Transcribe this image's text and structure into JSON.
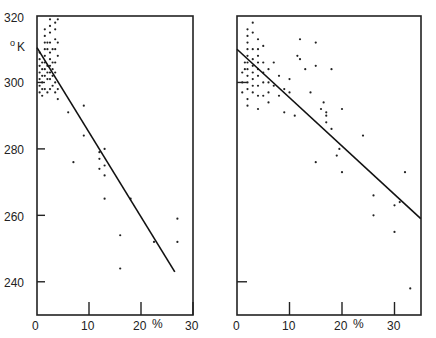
{
  "chart_data": [
    {
      "type": "scatter",
      "title": "",
      "xlabel": "%",
      "ylabel": "°K",
      "xlim": [
        0,
        30
      ],
      "ylim": [
        230,
        320
      ],
      "x_ticks": [
        0,
        10,
        20,
        30
      ],
      "x_tick_labels": [
        "0",
        "10",
        "20 %",
        "30"
      ],
      "y_ticks": [
        240,
        260,
        280,
        300,
        320
      ],
      "y_tick_labels": [
        "240",
        "260",
        "280",
        "300",
        "320"
      ],
      "grid": false,
      "legend": null,
      "fit_line": {
        "x": [
          0,
          26.5
        ],
        "y": [
          310.5,
          243
        ]
      },
      "points": [
        [
          0.5,
          309
        ],
        [
          0.5,
          307
        ],
        [
          0.5,
          305
        ],
        [
          0.5,
          303
        ],
        [
          0.5,
          301
        ],
        [
          0.5,
          299
        ],
        [
          0.5,
          297
        ],
        [
          1.0,
          306
        ],
        [
          1.0,
          304
        ],
        [
          1.0,
          302
        ],
        [
          1.0,
          300
        ],
        [
          1.0,
          298
        ],
        [
          1.0,
          296
        ],
        [
          1.5,
          316
        ],
        [
          1.5,
          314
        ],
        [
          1.5,
          312
        ],
        [
          1.5,
          310
        ],
        [
          1.5,
          308
        ],
        [
          1.5,
          306
        ],
        [
          1.5,
          304
        ],
        [
          1.5,
          302
        ],
        [
          1.5,
          298
        ],
        [
          2.0,
          312
        ],
        [
          2.0,
          310
        ],
        [
          2.0,
          305
        ],
        [
          2.0,
          303
        ],
        [
          2.0,
          301
        ],
        [
          2.0,
          297
        ],
        [
          2.5,
          319
        ],
        [
          2.5,
          317
        ],
        [
          2.5,
          315
        ],
        [
          2.5,
          312
        ],
        [
          2.5,
          309
        ],
        [
          2.5,
          307
        ],
        [
          2.5,
          305
        ],
        [
          2.5,
          303
        ],
        [
          2.5,
          301
        ],
        [
          2.5,
          298
        ],
        [
          3.0,
          310
        ],
        [
          3.0,
          306
        ],
        [
          3.0,
          304
        ],
        [
          3.0,
          302
        ],
        [
          3.0,
          299
        ],
        [
          3.5,
          318
        ],
        [
          3.5,
          316
        ],
        [
          3.5,
          313
        ],
        [
          3.5,
          310
        ],
        [
          3.5,
          306
        ],
        [
          3.5,
          303
        ],
        [
          3.5,
          300
        ],
        [
          3.5,
          297
        ],
        [
          4.0,
          319
        ],
        [
          4.0,
          312
        ],
        [
          4.0,
          308
        ],
        [
          4.0,
          298
        ],
        [
          4.0,
          295
        ],
        [
          6.0,
          291
        ],
        [
          7.0,
          276
        ],
        [
          9.0,
          293
        ],
        [
          9.0,
          284
        ],
        [
          12.0,
          279
        ],
        [
          12.0,
          277
        ],
        [
          12.0,
          274
        ],
        [
          13.0,
          280
        ],
        [
          13.0,
          275
        ],
        [
          13.0,
          272
        ],
        [
          13.0,
          265
        ],
        [
          16.0,
          254
        ],
        [
          16.0,
          244
        ],
        [
          18.0,
          265
        ],
        [
          22.5,
          252
        ],
        [
          27.0,
          259
        ],
        [
          27.0,
          252
        ]
      ]
    },
    {
      "type": "scatter",
      "title": "",
      "xlabel": "%",
      "ylabel": "",
      "xlim": [
        0,
        35
      ],
      "ylim": [
        230,
        320
      ],
      "x_ticks": [
        0,
        10,
        20,
        30
      ],
      "x_tick_labels": [
        "0",
        "10",
        "20 %",
        "30"
      ],
      "y_ticks": [
        240,
        300
      ],
      "y_tick_labels": [],
      "grid": false,
      "legend": null,
      "fit_line": {
        "x": [
          0,
          35
        ],
        "y": [
          310,
          259
        ]
      },
      "points": [
        [
          2.0,
          316
        ],
        [
          2.0,
          314
        ],
        [
          2.0,
          312
        ],
        [
          2.0,
          310
        ],
        [
          2.0,
          308
        ],
        [
          2.0,
          306
        ],
        [
          2.0,
          304
        ],
        [
          2.0,
          302
        ],
        [
          2.0,
          300
        ],
        [
          2.0,
          298
        ],
        [
          2.0,
          295
        ],
        [
          2.0,
          293
        ],
        [
          1.0,
          303
        ],
        [
          1.0,
          300
        ],
        [
          1.0,
          297
        ],
        [
          1.5,
          306
        ],
        [
          1.5,
          304
        ],
        [
          3.0,
          318
        ],
        [
          3.0,
          315
        ],
        [
          3.0,
          310
        ],
        [
          3.0,
          307
        ],
        [
          3.0,
          305
        ],
        [
          3.0,
          303
        ],
        [
          3.0,
          301
        ],
        [
          3.0,
          299
        ],
        [
          3.0,
          297
        ],
        [
          4.0,
          313
        ],
        [
          4.0,
          310
        ],
        [
          4.0,
          308
        ],
        [
          4.0,
          306
        ],
        [
          4.0,
          304
        ],
        [
          4.0,
          302
        ],
        [
          4.0,
          299
        ],
        [
          4.0,
          296
        ],
        [
          4.0,
          292
        ],
        [
          5.0,
          311
        ],
        [
          5.0,
          306
        ],
        [
          5.0,
          303
        ],
        [
          5.0,
          300
        ],
        [
          5.0,
          296
        ],
        [
          6.0,
          304
        ],
        [
          6.0,
          300
        ],
        [
          6.0,
          297
        ],
        [
          6.0,
          294
        ],
        [
          7.0,
          306
        ],
        [
          7.0,
          299
        ],
        [
          8.0,
          302
        ],
        [
          8.0,
          296
        ],
        [
          9.0,
          298
        ],
        [
          9.0,
          291
        ],
        [
          10.0,
          301
        ],
        [
          10.0,
          297
        ],
        [
          11.0,
          290
        ],
        [
          11.5,
          308
        ],
        [
          12.0,
          313
        ],
        [
          12.0,
          307
        ],
        [
          13.0,
          304
        ],
        [
          14.0,
          297
        ],
        [
          15.0,
          312
        ],
        [
          15.0,
          305
        ],
        [
          15.0,
          276
        ],
        [
          16.0,
          292
        ],
        [
          16.5,
          294
        ],
        [
          17.0,
          291
        ],
        [
          17.0,
          290
        ],
        [
          17.0,
          288
        ],
        [
          18.0,
          304
        ],
        [
          18.0,
          286
        ],
        [
          19.0,
          278
        ],
        [
          19.5,
          280
        ],
        [
          20.0,
          273
        ],
        [
          20.0,
          292
        ],
        [
          24.0,
          284
        ],
        [
          26.0,
          266
        ],
        [
          26.0,
          260
        ],
        [
          30.0,
          263
        ],
        [
          30.0,
          255
        ],
        [
          31.0,
          264
        ],
        [
          32.0,
          273
        ],
        [
          33.0,
          238
        ]
      ]
    }
  ],
  "panels": {
    "left": {
      "y_unit": "°K",
      "y_labels": [
        "320",
        "300",
        "280",
        "260",
        "240"
      ],
      "x_labels": [
        "0",
        "10",
        "20",
        "%",
        "30"
      ]
    },
    "right": {
      "x_labels": [
        "0",
        "10",
        "20",
        "%",
        "30"
      ]
    }
  }
}
